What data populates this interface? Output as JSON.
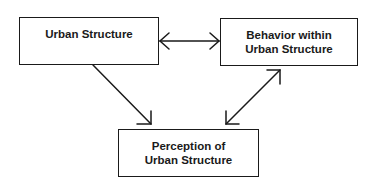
{
  "diagram": {
    "nodes": [
      {
        "id": "urban_structure",
        "lines": [
          "Urban Structure"
        ]
      },
      {
        "id": "behavior",
        "lines": [
          "Behavior within",
          "Urban Structure"
        ]
      },
      {
        "id": "perception",
        "lines": [
          "Perception of",
          "Urban Structure"
        ]
      }
    ],
    "edges": [
      {
        "from": "urban_structure",
        "to": "behavior",
        "direction": "bidirectional"
      },
      {
        "from": "urban_structure",
        "to": "perception",
        "direction": "forward"
      },
      {
        "from": "behavior",
        "to": "perception",
        "direction": "bidirectional"
      }
    ],
    "colors": {
      "stroke": "#1a1a1a",
      "background": "#ffffff"
    }
  }
}
